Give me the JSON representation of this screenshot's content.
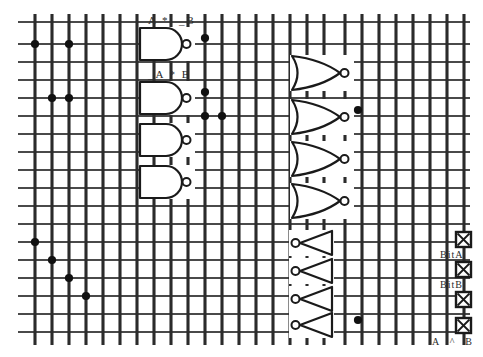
{
  "canvas": {
    "width": 483,
    "height": 357,
    "background": "#ffffff",
    "wire_color": "#4a4a4a",
    "bus_color": "#2b2b2b",
    "gate_color": "#1a1a1a",
    "dot_color": "#111111",
    "title": "Logic gate array schematic"
  },
  "grid": {
    "vertical_lines_x": [
      35,
      52,
      69,
      86,
      103,
      120,
      137,
      154,
      171,
      188,
      205,
      222,
      239,
      256,
      273,
      290,
      307,
      324,
      345,
      362,
      379,
      396,
      413,
      430,
      447,
      464
    ],
    "horizontal_lines_y": [
      22,
      44,
      62,
      80,
      98,
      116,
      134,
      152,
      170,
      188,
      206,
      224,
      242,
      260,
      278,
      296,
      314,
      332
    ],
    "vertical_top": 14,
    "vertical_bottom": 345,
    "horizontal_left": 18,
    "horizontal_right": 470
  },
  "junction_dots": [
    {
      "x": 35,
      "y": 44,
      "name": "junction-a1"
    },
    {
      "x": 69,
      "y": 44,
      "name": "junction-a2"
    },
    {
      "x": 52,
      "y": 98,
      "name": "junction-b1"
    },
    {
      "x": 69,
      "y": 98,
      "name": "junction-b2"
    },
    {
      "x": 205,
      "y": 38,
      "name": "junction-c1"
    },
    {
      "x": 205,
      "y": 116,
      "name": "junction-c2"
    },
    {
      "x": 205,
      "y": 92,
      "name": "junction-c3"
    },
    {
      "x": 222,
      "y": 116,
      "name": "junction-c4"
    },
    {
      "x": 358,
      "y": 110,
      "name": "junction-d1"
    },
    {
      "x": 358,
      "y": 320,
      "name": "junction-d2"
    },
    {
      "x": 35,
      "y": 242,
      "name": "junction-e1"
    },
    {
      "x": 52,
      "y": 260,
      "name": "junction-e2"
    },
    {
      "x": 69,
      "y": 278,
      "name": "junction-e3"
    },
    {
      "x": 86,
      "y": 296,
      "name": "junction-e4"
    }
  ],
  "nand_gates": [
    {
      "name": "nand-gate-1",
      "x": 140,
      "y": 28,
      "w": 42,
      "h": 32,
      "label": "A *  _B",
      "label_x": 148,
      "label_y": 14
    },
    {
      "name": "nand-gate-2",
      "x": 140,
      "y": 82,
      "w": 42,
      "h": 32,
      "label": "_A * B",
      "label_x": 148,
      "label_y": 68
    },
    {
      "name": "nand-gate-3",
      "x": 140,
      "y": 124,
      "w": 42,
      "h": 32,
      "label": "",
      "label_x": 0,
      "label_y": 0
    },
    {
      "name": "nand-gate-4",
      "x": 140,
      "y": 166,
      "w": 42,
      "h": 32,
      "label": "",
      "label_x": 0,
      "label_y": 0
    }
  ],
  "nor_gates": [
    {
      "name": "nor-gate-1",
      "x": 292,
      "y": 56,
      "w": 48,
      "h": 34
    },
    {
      "name": "nor-gate-2",
      "x": 292,
      "y": 100,
      "w": 48,
      "h": 34
    },
    {
      "name": "nor-gate-3",
      "x": 292,
      "y": 142,
      "w": 48,
      "h": 34
    },
    {
      "name": "nor-gate-4",
      "x": 292,
      "y": 184,
      "w": 48,
      "h": 34
    }
  ],
  "inverters": [
    {
      "name": "inverter-1",
      "x": 300,
      "y": 231,
      "w": 32,
      "h": 24
    },
    {
      "name": "inverter-2",
      "x": 300,
      "y": 259,
      "w": 32,
      "h": 24
    },
    {
      "name": "inverter-3",
      "x": 300,
      "y": 287,
      "w": 32,
      "h": 24
    },
    {
      "name": "inverter-4",
      "x": 300,
      "y": 313,
      "w": 32,
      "h": 24
    }
  ],
  "terminals": [
    {
      "name": "terminal-1",
      "x": 456,
      "y": 232,
      "size": 15,
      "label": "BitA",
      "label_x": 440,
      "label_y": 249
    },
    {
      "name": "terminal-2",
      "x": 456,
      "y": 262,
      "size": 15,
      "label": "BitB",
      "label_x": 440,
      "label_y": 279
    },
    {
      "name": "terminal-3",
      "x": 456,
      "y": 292,
      "size": 15,
      "label": "",
      "label_x": 0,
      "label_y": 0
    },
    {
      "name": "terminal-4",
      "x": 456,
      "y": 318,
      "size": 15,
      "label": "",
      "label_x": 0,
      "label_y": 0
    }
  ],
  "bottom_label": {
    "text": "A  ^  B",
    "x": 432,
    "y": 336
  }
}
